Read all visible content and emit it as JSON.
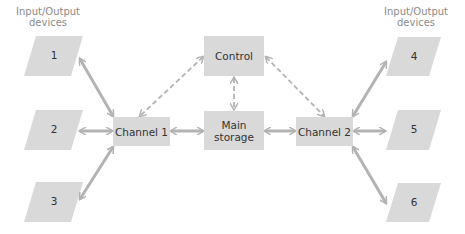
{
  "diagram": {
    "left_heading": "Input/Output devices",
    "right_heading": "Input/Output devices",
    "control": "Control",
    "main_storage": "Main storage",
    "channel1": "Channel 1",
    "channel2": "Channel 2",
    "devices_left": [
      "1",
      "2",
      "3"
    ],
    "devices_right": [
      "4",
      "5",
      "6"
    ],
    "colors": {
      "box_fill": "#d9d9d9",
      "arrow": "#b3b3b3",
      "heading_text": "#8a8a8a",
      "box_text": "#333333"
    }
  }
}
